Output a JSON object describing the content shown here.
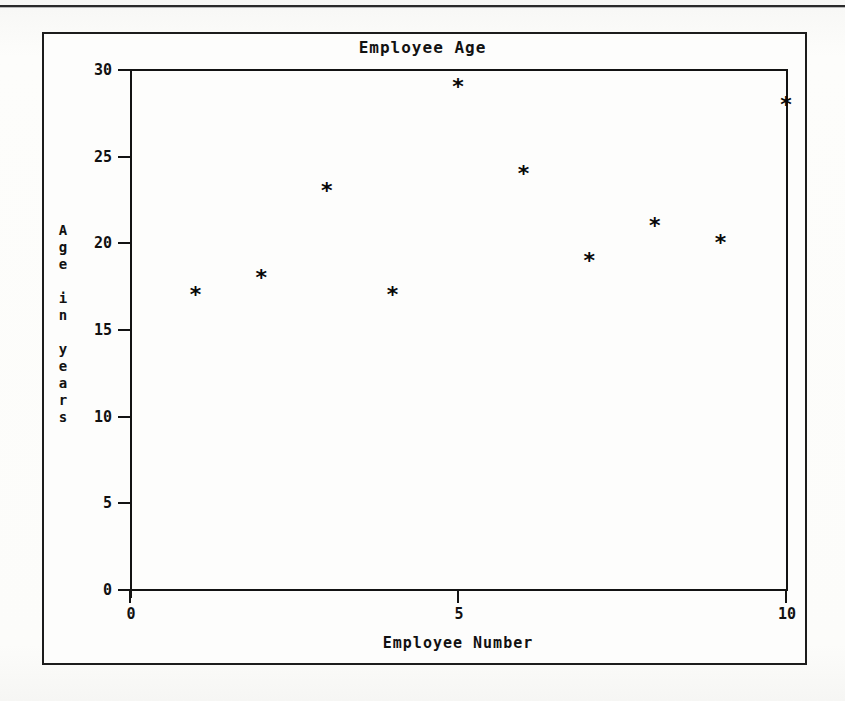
{
  "page": {
    "background_color": "#fbfbf9",
    "frame_color": "#1c1c1c"
  },
  "chart_data": {
    "type": "scatter",
    "title": "Employee Age",
    "xlabel": "Employee Number",
    "ylabel": "Age in years",
    "ylabel_stacked": "A\ng\ne\n\ni\nn\n\ny\ne\na\nr\ns",
    "marker": "*",
    "marker_color": "#080808",
    "grid": false,
    "legend": false,
    "xlim": [
      0,
      10
    ],
    "ylim": [
      0,
      30
    ],
    "xticks": [
      "0",
      "5",
      "10"
    ],
    "xtick_values": [
      0,
      5,
      10
    ],
    "yticks": [
      "0",
      "5",
      "10",
      "15",
      "20",
      "25",
      "30"
    ],
    "ytick_values": [
      0,
      5,
      10,
      15,
      20,
      25,
      30
    ],
    "x": [
      1,
      2,
      3,
      4,
      5,
      6,
      7,
      8,
      9,
      10
    ],
    "values": [
      17,
      18,
      23,
      17,
      29,
      24,
      19,
      21,
      20,
      28
    ],
    "points": [
      {
        "x": 1,
        "y": 17
      },
      {
        "x": 2,
        "y": 18
      },
      {
        "x": 3,
        "y": 23
      },
      {
        "x": 4,
        "y": 17
      },
      {
        "x": 5,
        "y": 29
      },
      {
        "x": 6,
        "y": 24
      },
      {
        "x": 7,
        "y": 19
      },
      {
        "x": 8,
        "y": 21
      },
      {
        "x": 9,
        "y": 20
      },
      {
        "x": 10,
        "y": 28
      }
    ]
  }
}
